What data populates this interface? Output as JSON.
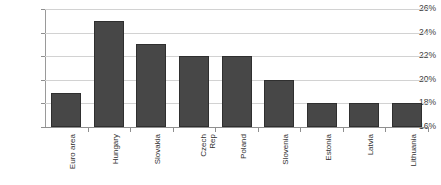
{
  "chart_data": {
    "type": "bar",
    "title": "",
    "subtitle": "",
    "xlabel": "",
    "ylabel": "",
    "categories": [
      "Euro area",
      "Hungary",
      "Slovakia",
      "Czech Rep",
      "Poland",
      "Slovenia",
      "Estonia",
      "Latvia",
      "Lithuania"
    ],
    "category_lines": [
      [
        "Euro area"
      ],
      [
        "Hungary"
      ],
      [
        "Slovakia"
      ],
      [
        "Czech",
        "Rep"
      ],
      [
        "Poland"
      ],
      [
        "Slovenia"
      ],
      [
        "Estonia"
      ],
      [
        "Latvia"
      ],
      [
        "Lithuania"
      ]
    ],
    "values": [
      18.9,
      25.0,
      23.0,
      22.0,
      22.0,
      20.0,
      18.0,
      18.0,
      18.0
    ],
    "ylim": [
      16,
      26
    ],
    "ytick_values": [
      16,
      18,
      20,
      22,
      24,
      26
    ],
    "ytick_labels": [
      "16%",
      "18%",
      "20%",
      "22%",
      "24%",
      "26%"
    ],
    "grid": true,
    "legend": false,
    "legend_position": "none",
    "bar_color": "#474747",
    "bar_border_color": "#2f2f2f",
    "grid_color": "#d2d2d2",
    "axis_color": "#8f8f8f",
    "background_color": "#ffffff",
    "value_labels_shown": false
  }
}
